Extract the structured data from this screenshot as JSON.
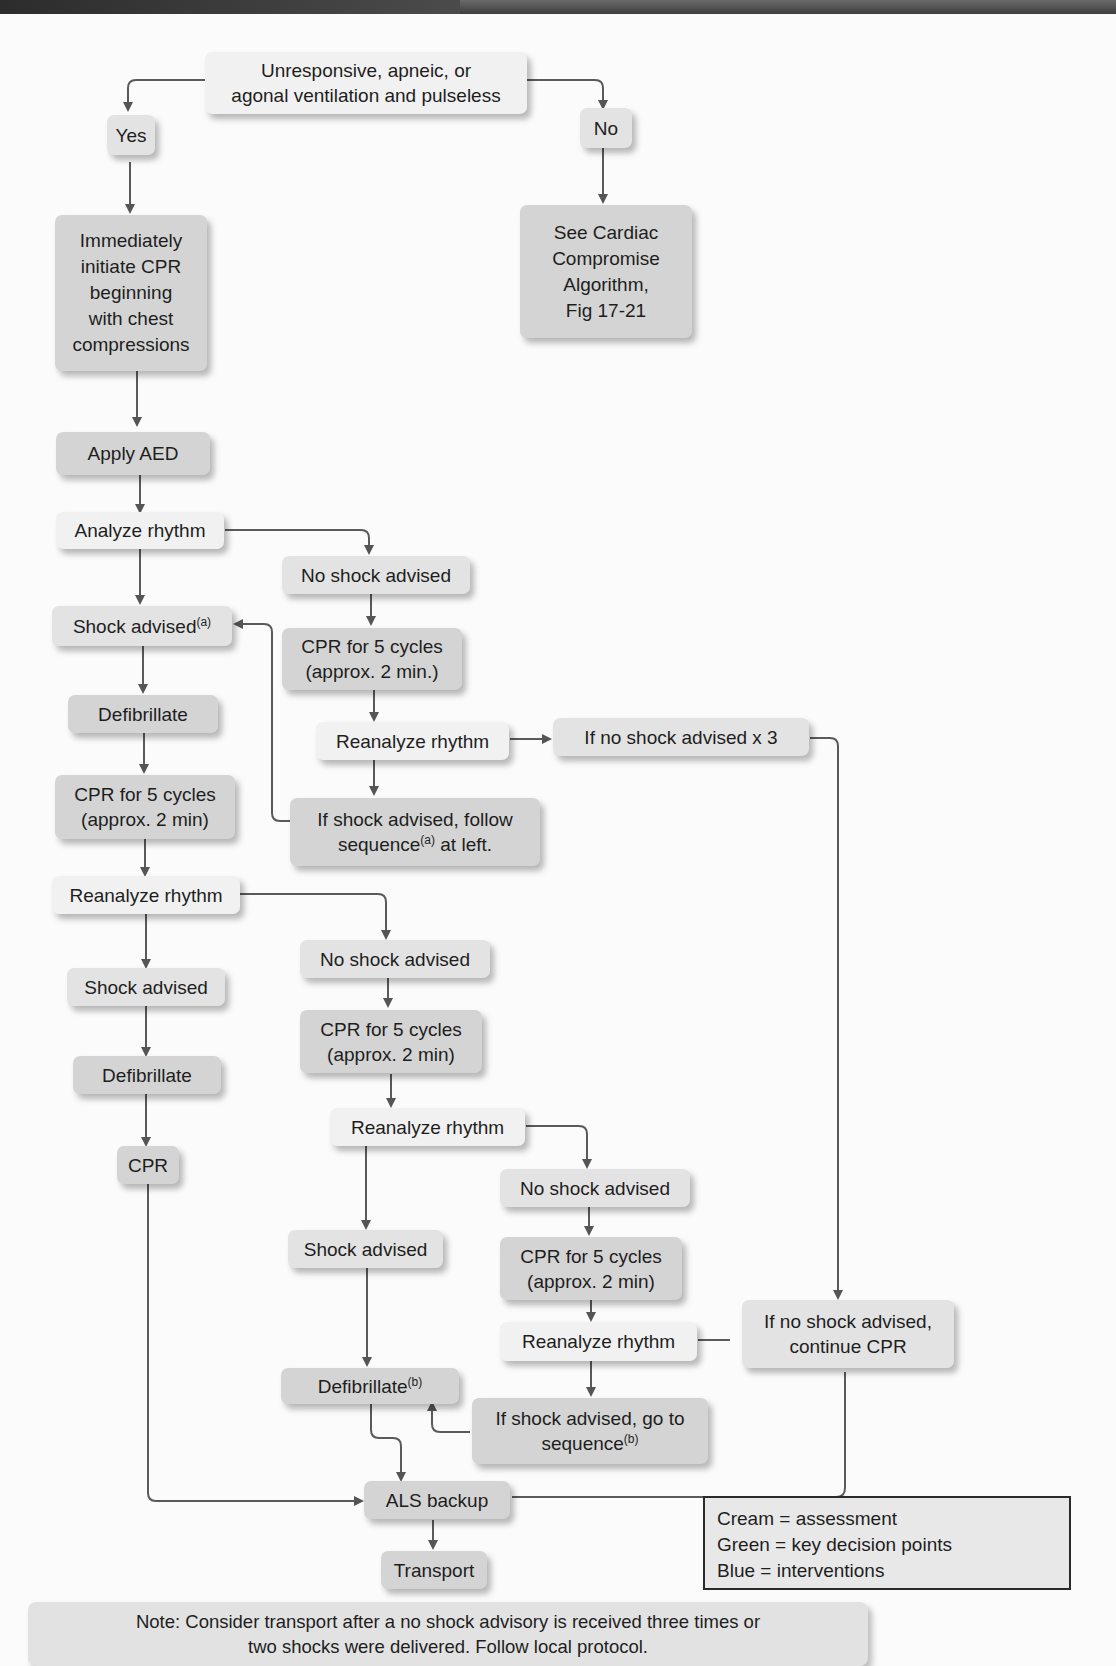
{
  "nodes": {
    "start": {
      "line1": "Unresponsive, apneic, or",
      "line2": "agonal ventilation and pulseless",
      "type": "cream"
    },
    "yes": {
      "label": "Yes",
      "type": "green"
    },
    "no": {
      "label": "No",
      "type": "green"
    },
    "initiate_cpr": {
      "lines": [
        "Immediately",
        "initiate CPR",
        "beginning",
        "with chest",
        "compressions"
      ],
      "type": "blue"
    },
    "see_cardiac": {
      "lines": [
        "See Cardiac",
        "Compromise",
        "Algorithm,",
        "Fig 17-21"
      ],
      "type": "blue"
    },
    "apply_aed": {
      "label": "Apply AED",
      "type": "blue"
    },
    "analyze_rhythm": {
      "label": "Analyze rhythm",
      "type": "cream"
    },
    "no_shock_1": {
      "label": "No shock advised",
      "type": "green"
    },
    "shock_advised_a": {
      "label": "Shock advised",
      "sup": "(a)",
      "type": "green"
    },
    "cpr_cycles_1": {
      "line1": "CPR for 5 cycles",
      "line2": "(approx. 2 min.)",
      "type": "blue"
    },
    "defibrillate_1": {
      "label": "Defibrillate",
      "type": "blue"
    },
    "reanalyze_1": {
      "label": "Reanalyze rhythm",
      "type": "cream"
    },
    "no_shock_x3": {
      "label": "If no shock advised x 3",
      "type": "green"
    },
    "cpr_cycles_2": {
      "line1": "CPR for 5 cycles",
      "line2": "(approx. 2 min)",
      "type": "blue"
    },
    "follow_seq_a": {
      "line1": "If shock advised, follow",
      "line2_pre": "sequence",
      "line2_sup": "(a)",
      "line2_post": " at left.",
      "type": "blue"
    },
    "reanalyze_2": {
      "label": "Reanalyze rhythm",
      "type": "cream"
    },
    "no_shock_2": {
      "label": "No shock advised",
      "type": "green"
    },
    "shock_advised_2": {
      "label": "Shock advised",
      "type": "green"
    },
    "cpr_cycles_3": {
      "line1": "CPR for 5 cycles",
      "line2": "(approx. 2 min)",
      "type": "blue"
    },
    "defibrillate_2": {
      "label": "Defibrillate",
      "type": "blue"
    },
    "reanalyze_3": {
      "label": "Reanalyze rhythm",
      "type": "cream"
    },
    "cpr": {
      "label": "CPR",
      "type": "blue"
    },
    "no_shock_3": {
      "label": "No shock advised",
      "type": "green"
    },
    "shock_advised_3": {
      "label": "Shock advised",
      "type": "green"
    },
    "cpr_cycles_4": {
      "line1": "CPR for 5 cycles",
      "line2": "(approx. 2 min)",
      "type": "blue"
    },
    "reanalyze_4": {
      "label": "Reanalyze rhythm",
      "type": "cream"
    },
    "continue_cpr": {
      "line1": "If no shock advised,",
      "line2": "continue CPR",
      "type": "green"
    },
    "defibrillate_b": {
      "label": "Defibrillate",
      "sup": "(b)",
      "type": "blue"
    },
    "go_to_seq_b": {
      "line1": "If shock advised, go to",
      "line2_pre": "sequence",
      "line2_sup": "(b)",
      "type": "blue"
    },
    "als_backup": {
      "label": "ALS backup",
      "type": "blue"
    },
    "transport": {
      "label": "Transport",
      "type": "blue"
    }
  },
  "legend": {
    "items": [
      "Cream = assessment",
      "Green = key decision points",
      "Blue = interventions"
    ]
  },
  "note": {
    "line1": "Note: Consider transport after a no shock advisory is received three times or",
    "line2": "two shocks were delivered. Follow local protocol."
  }
}
